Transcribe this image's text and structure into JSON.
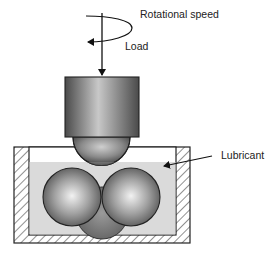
{
  "diagram": {
    "type": "four-ball tribometer schematic",
    "labels": {
      "rotational_speed": "Rotational speed",
      "load": "Load",
      "lubricant": "Lubricant"
    },
    "colors": {
      "background": "#ffffff",
      "outline": "#222222",
      "lubricant_fill": "#dadada",
      "cup_hatch": "#555555",
      "spindle_dark": "#555555",
      "spindle_light": "#bdbdbd",
      "ball_dark": "#5a5a5a",
      "ball_light": "#f0f0f0"
    },
    "components": [
      "rotating spindle",
      "top ball",
      "three bottom balls",
      "lubricant bath",
      "hatched cup"
    ]
  }
}
